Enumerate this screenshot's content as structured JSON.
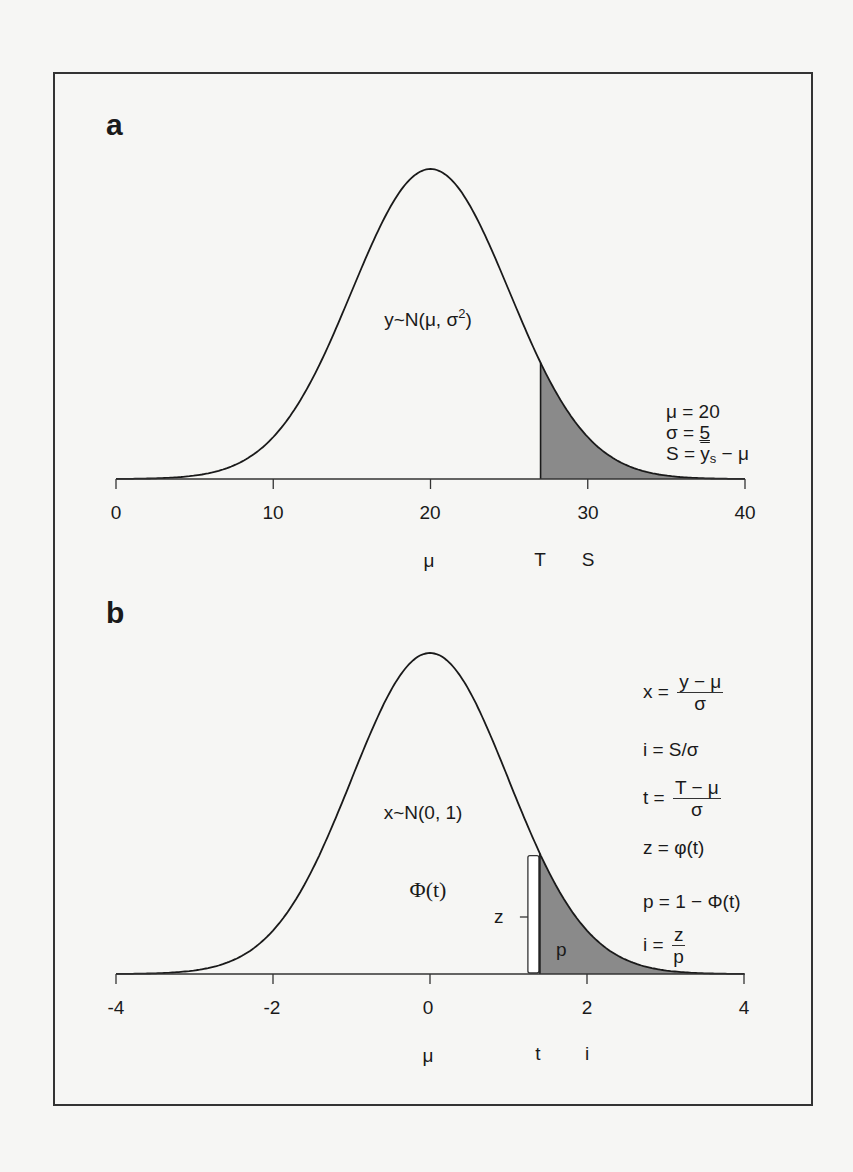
{
  "chart_data": [
    {
      "panel": "a",
      "type": "area",
      "title": "",
      "distribution": "y~N(μ, σ²)",
      "mu": 20,
      "sigma": 5,
      "truncation_point_T": 27,
      "selection_differential_S": 10,
      "shaded_region": "right tail above T",
      "xlim": [
        0,
        40
      ],
      "x_ticks": [
        0,
        10,
        20,
        30,
        40
      ],
      "x_tick_labels": [
        "0",
        "10",
        "20",
        "30",
        "40"
      ],
      "below_axis_markers": [
        {
          "label": "μ",
          "x": 20
        },
        {
          "label": "T",
          "x": 27
        },
        {
          "label": "S",
          "x": 30
        }
      ],
      "annotations": [
        "μ = 20",
        "σ = 5",
        "S = ȳs − μ"
      ],
      "grid": false
    },
    {
      "panel": "b",
      "type": "area",
      "title": "",
      "distribution": "x~N(0, 1)",
      "mu": 0,
      "sigma": 1,
      "truncation_point_t": 1.4,
      "intensity_i": 2,
      "shaded_region": "right tail above t (p)",
      "xlim": [
        -4,
        4
      ],
      "x_ticks": [
        -4,
        -2,
        0,
        2,
        4
      ],
      "x_tick_labels": [
        "-4",
        "-2",
        "0",
        "2",
        "4"
      ],
      "below_axis_markers": [
        {
          "label": "μ",
          "x": 0
        },
        {
          "label": "t",
          "x": 1.4
        },
        {
          "label": "i",
          "x": 2
        }
      ],
      "annotations": [
        "x = (y − μ)/σ",
        "i = S/σ",
        "t = (T − μ)/σ",
        "z = φ(t)",
        "p = 1 − Φ(t)",
        "i = z/p",
        "Φ(t)",
        "z",
        "p"
      ],
      "grid": false
    }
  ],
  "colors": {
    "background": "#f6f6f4",
    "line": "#1a1a1a",
    "shade": "#8a8a8a",
    "brace_fill": "#ffffff"
  },
  "panel_a": {
    "label": "a",
    "dist_label": "y~N(μ, σ",
    "dist_sup": "2",
    "dist_close": ")",
    "ticks": [
      "0",
      "10",
      "20",
      "30",
      "40"
    ],
    "mu_marker": "μ",
    "T_marker": "T",
    "S_marker": "S",
    "legend": {
      "line1": "μ = 20",
      "line2_left": "σ = ",
      "line2_val": "5",
      "line3_left": "S = ",
      "line3_ybar": "y",
      "line3_sub": "s",
      "line3_right": " − μ"
    }
  },
  "panel_b": {
    "label": "b",
    "dist_label": "x~N(0, 1)",
    "cdf_label": "Φ(t)",
    "ticks": [
      "-4",
      "-2",
      "0",
      "2",
      "4"
    ],
    "mu_marker": "μ",
    "t_marker": "t",
    "i_marker": "i",
    "z_label": "z",
    "p_label": "p",
    "formulas": {
      "x_lhs": "x = ",
      "x_num": "y − μ",
      "x_den": "σ",
      "i1": "i = S/σ",
      "t_lhs": "t = ",
      "t_num": "T − μ",
      "t_den": "σ",
      "z": "z = φ(t)",
      "p": "p = 1 − Φ(t)",
      "i2_lhs": "i = ",
      "i2_num": "z",
      "i2_den": "p"
    }
  }
}
